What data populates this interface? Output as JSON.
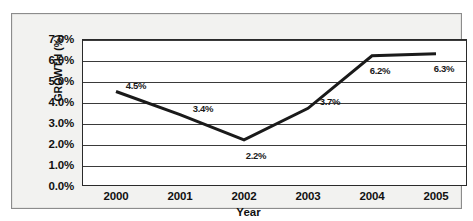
{
  "chart_data": {
    "type": "line",
    "title": "",
    "xlabel": "Year",
    "ylabel": "GROWTH (%)",
    "categories": [
      "2000",
      "2001",
      "2002",
      "2003",
      "2004",
      "2005"
    ],
    "values": [
      4.5,
      3.4,
      2.2,
      3.7,
      6.2,
      6.3
    ],
    "point_labels": [
      "4.5%",
      "3.4%",
      "2.2%",
      "3.7%",
      "6.2%",
      "6.3%"
    ],
    "ylim": [
      0.0,
      7.0
    ],
    "ytick_labels": [
      "7.0%",
      "6.0%",
      "5.0%",
      "4.0%",
      "3.0%",
      "2.0%",
      "1.0%",
      "0.0%"
    ],
    "ytick_values": [
      7.0,
      6.0,
      5.0,
      4.0,
      3.0,
      2.0,
      1.0,
      0.0
    ],
    "grid": true,
    "legend": false,
    "legend_position": "none",
    "series": [
      {
        "name": "Growth",
        "values": [
          4.5,
          3.4,
          2.2,
          3.7,
          6.2,
          6.3
        ],
        "color": "#1a1a1a",
        "line_width": 3
      }
    ],
    "colors": {
      "line": "#1a1a1a",
      "grid": "#3a3a3a",
      "plot_background": "#ffffff",
      "frame_background": "#f2f2f0",
      "frame_border": "#8c8c8c",
      "text": "#111111"
    }
  },
  "axis": {
    "y_title": "GROWTH (%)",
    "x_title": "Year"
  }
}
